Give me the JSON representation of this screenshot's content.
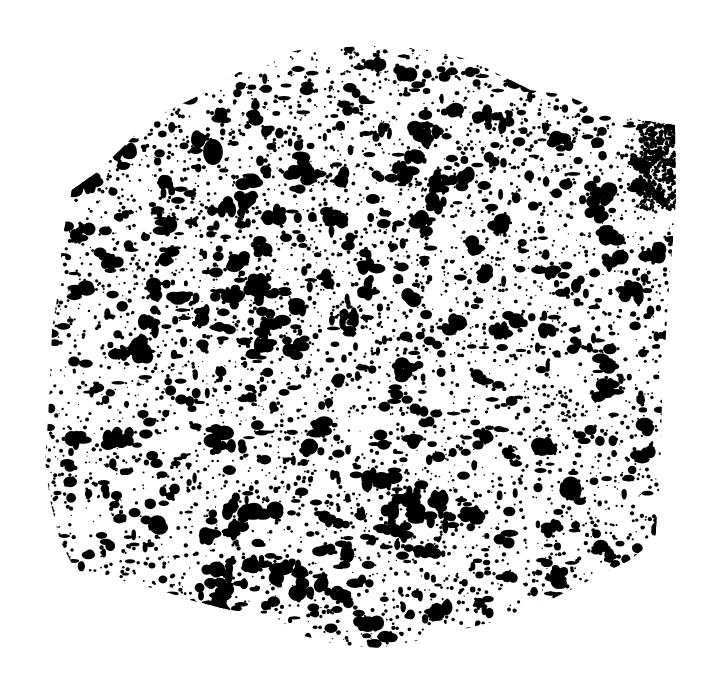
{
  "image": {
    "description": "Binarized black-and-white cross-section of a porous rock slab",
    "background_color": "#ffffff",
    "foreground_color": "#000000",
    "width": 706,
    "height": 685
  },
  "specimen": {
    "outline": [
      [
        72,
        190
      ],
      [
        100,
        170
      ],
      [
        150,
        120
      ],
      [
        200,
        95
      ],
      [
        260,
        60
      ],
      [
        300,
        50
      ],
      [
        380,
        45
      ],
      [
        430,
        50
      ],
      [
        470,
        60
      ],
      [
        500,
        75
      ],
      [
        530,
        90
      ],
      [
        565,
        95
      ],
      [
        600,
        110
      ],
      [
        640,
        120
      ],
      [
        675,
        125
      ],
      [
        676,
        200
      ],
      [
        668,
        300
      ],
      [
        662,
        400
      ],
      [
        660,
        480
      ],
      [
        655,
        540
      ],
      [
        630,
        560
      ],
      [
        610,
        570
      ],
      [
        580,
        585
      ],
      [
        540,
        605
      ],
      [
        500,
        620
      ],
      [
        460,
        630
      ],
      [
        420,
        640
      ],
      [
        380,
        648
      ],
      [
        340,
        645
      ],
      [
        300,
        635
      ],
      [
        270,
        615
      ],
      [
        230,
        610
      ],
      [
        190,
        600
      ],
      [
        160,
        590
      ],
      [
        120,
        580
      ],
      [
        95,
        575
      ],
      [
        75,
        570
      ],
      [
        60,
        540
      ],
      [
        50,
        500
      ],
      [
        45,
        460
      ],
      [
        48,
        420
      ],
      [
        50,
        380
      ],
      [
        52,
        330
      ],
      [
        60,
        280
      ],
      [
        62,
        240
      ]
    ],
    "dark_edge_band": {
      "x": 640,
      "y": 120,
      "w": 36,
      "h": 90
    }
  }
}
